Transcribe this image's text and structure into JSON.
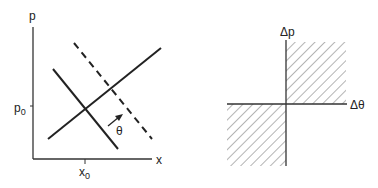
{
  "left_plot": {
    "y_axis_label": "p",
    "x_axis_label": "x",
    "y_tick_label": "p",
    "y_tick_subscript": "0",
    "x_tick_label": "x",
    "x_tick_subscript": "0",
    "angle_label": "θ",
    "lines": [
      {
        "name": "rising-line",
        "style": "solid"
      },
      {
        "name": "falling-line",
        "style": "solid"
      },
      {
        "name": "shifted-falling-line",
        "style": "dashed"
      }
    ]
  },
  "right_plot": {
    "y_axis_label": "Δp",
    "x_axis_label": "Δθ",
    "hatched_quadrants": [
      "upper-right",
      "lower-left"
    ]
  },
  "colors": {
    "ink": "#222222",
    "background": "#ffffff"
  }
}
